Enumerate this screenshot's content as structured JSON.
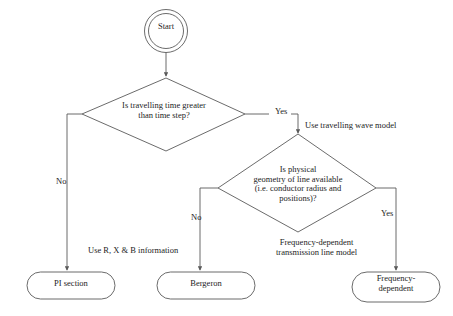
{
  "diagram": {
    "stroke_color": "#5a5a5a",
    "text_color": "#1c1c1c",
    "background": "#ffffff",
    "nodes": {
      "start": {
        "label": "Start",
        "shape": "double-circle"
      },
      "decision_time": {
        "label": "Is travelling time greater\nthan time step?",
        "shape": "diamond"
      },
      "decision_geometry": {
        "label": "Is physical\ngeometry of line available\n(i.e. conductor radius and\npositions)?",
        "shape": "diamond"
      },
      "pi_section": {
        "label": "PI section",
        "shape": "stadium"
      },
      "bergeron": {
        "label": "Bergeron",
        "shape": "stadium"
      },
      "frequency_dependent": {
        "label": "Frequency-\ndependent",
        "shape": "stadium"
      }
    },
    "edge_labels": {
      "yes_time": "Yes",
      "no_time": "No",
      "use_travelling_wave_model": "Use travelling wave model",
      "no_geometry": "No",
      "yes_geometry": "Yes",
      "use_rxb_information": "Use R, X & B information",
      "frequency_dependent_model": "Frequency-dependent\ntransmission line model"
    }
  }
}
